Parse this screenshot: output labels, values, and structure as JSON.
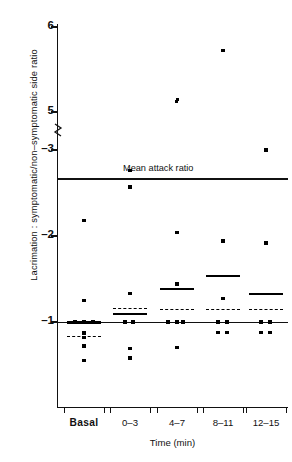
{
  "chart_data": {
    "type": "scatter",
    "title": "",
    "xlabel": "Time (min)",
    "ylabel": "Lacrimation : symptomatic/non–symptomatic side ratio",
    "categories": [
      "Basal",
      "0–3",
      "4–7",
      "8–11",
      "12–15"
    ],
    "ytick_labels": [
      "6",
      "5",
      "–3",
      "–2",
      "–1"
    ],
    "ytick_values": [
      6,
      5,
      3,
      2,
      1
    ],
    "axis_break": true,
    "axis_break_between": [
      5,
      3
    ],
    "grid": false,
    "legend": "none",
    "annotations": [
      {
        "name": "mean-attack-ratio",
        "label": "Mean attack ratio",
        "value": 2.75
      }
    ],
    "series": [
      {
        "name": "Basal",
        "points": [
          2.18,
          1.25,
          1.0,
          1.0,
          1.0,
          0.87,
          0.82,
          0.72,
          0.55
        ],
        "mean_solid": 1.0,
        "mean_dashed": 0.82
      },
      {
        "name": "0–3",
        "points": [
          2.76,
          2.57,
          1.33,
          1.0,
          1.0,
          0.69,
          0.58
        ],
        "mean_solid": 1.09,
        "mean_dashed": 1.15
      },
      {
        "name": "4–7",
        "points": [
          5.15,
          5.12,
          2.04,
          1.44,
          1.0,
          1.0,
          1.0,
          0.7
        ],
        "mean_solid": 1.38,
        "mean_dashed": 1.14
      },
      {
        "name": "8–11",
        "points": [
          5.72,
          1.94,
          1.27,
          1.0,
          1.0,
          0.88,
          0.88
        ],
        "mean_solid": 1.53,
        "mean_dashed": 1.14
      },
      {
        "name": "12–15",
        "points": [
          3.0,
          1.92,
          1.0,
          1.0,
          0.88,
          0.88
        ],
        "mean_solid": 1.32,
        "mean_dashed": 1.14
      }
    ],
    "baseline": 1.0
  },
  "figure": {
    "ylabel_text": "Lacrimation : symptomatic/non–symptomatic side ratio",
    "xlabel_text": "Time (min)",
    "mean_attack_label": "Mean attack ratio",
    "ytick_labels": [
      "6",
      "5",
      "–3",
      "–2",
      "–1"
    ],
    "xtick_labels": [
      "Basal",
      "0–3",
      "4–7",
      "8–11",
      "12–15"
    ],
    "ink_color": "#111111"
  }
}
